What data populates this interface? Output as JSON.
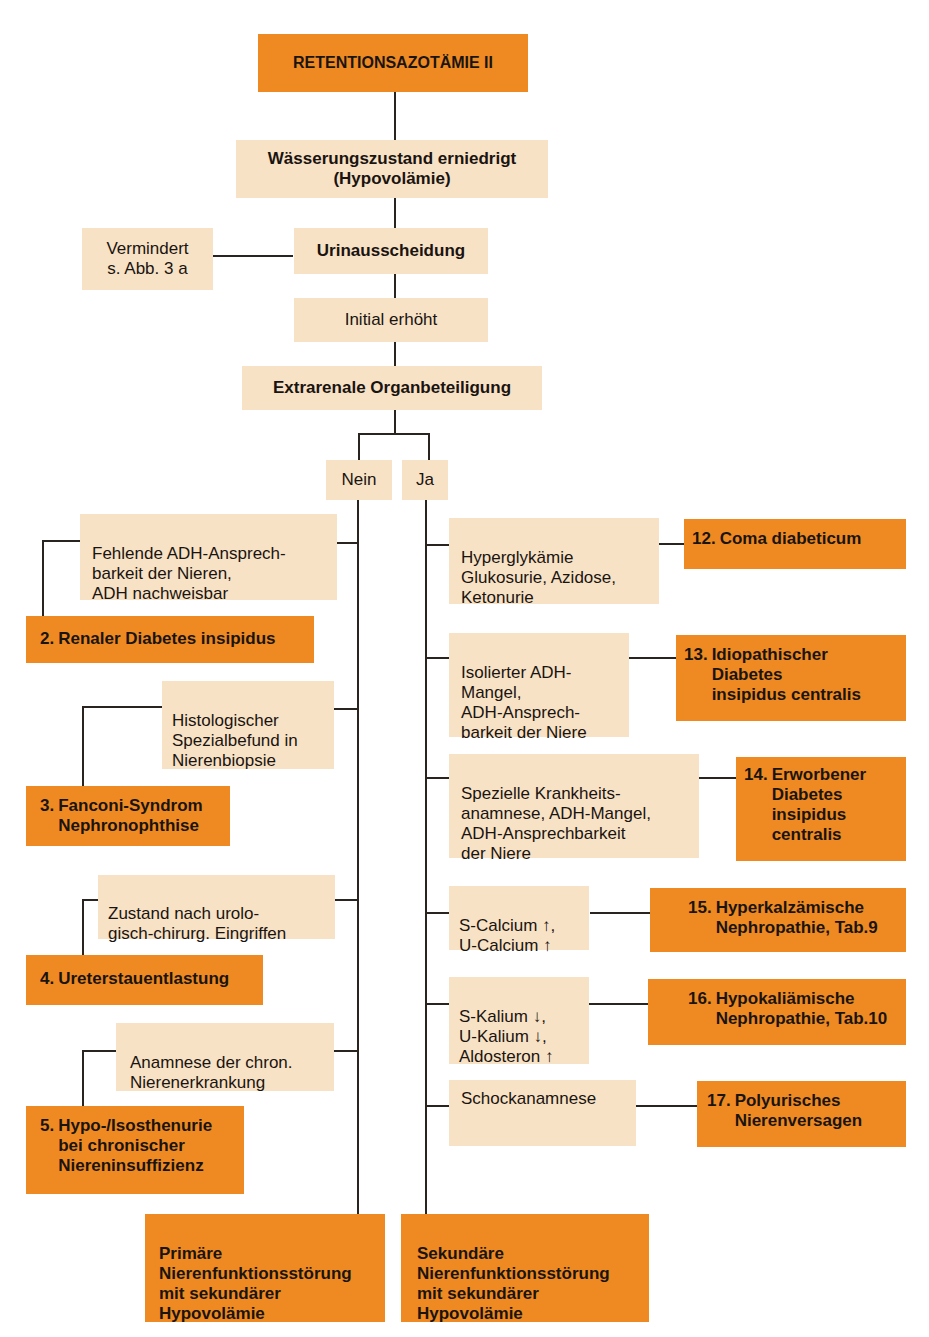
{
  "title": "RETENTIONSAZOTÄMIE II",
  "nodes": {
    "hydration": "Wässerungszustand erniedrigt\n(Hypovolämie)",
    "urine_excretion": "Urinausscheidung",
    "reduced": "Vermindert\ns. Abb. 3 a",
    "initial_increased": "Initial erhöht",
    "extrarenal": "Extrarenale Organbeteiligung",
    "no": "Nein",
    "yes": "Ja"
  },
  "left_branch": {
    "criteria": [
      "Fehlende ADH-Ansprech-\nbarkeit der Nieren,\nADH nachweisbar",
      "Histologischer\nSpezialbefund in\nNierenbiopsie",
      "Zustand nach urolo-\ngisch-chirurg. Eingriffen",
      "Anamnese der chron.\nNierenerkrankung"
    ],
    "diagnoses": [
      {
        "num": "2.",
        "text": "Renaler Diabetes insipidus"
      },
      {
        "num": "3.",
        "text": "Fanconi-Syndrom\nNephronophthise"
      },
      {
        "num": "4.",
        "text": "Ureterstauentlastung"
      },
      {
        "num": "5.",
        "text": "Hypo-/Isosthenurie\nbei chronischer\nNiereninsuffizienz"
      }
    ],
    "conclusion": "Primäre\nNierenfunktionsstörung\nmit sekundärer\nHypovolämie"
  },
  "right_branch": {
    "criteria": [
      "Hyperglykämie\nGlukosurie, Azidose,\nKetonurie",
      "Isolierter ADH-\nMangel,\nADH-Ansprech-\nbarkeit der Niere",
      "Spezielle Krankheits-\nanamnese, ADH-Mangel,\nADH-Ansprechbarkeit\nder Niere",
      "S-Calcium ↑,\nU-Calcium ↑",
      "S-Kalium ↓,\nU-Kalium ↓,\nAldosteron ↑",
      "Schockanamnese"
    ],
    "diagnoses": [
      {
        "num": "12.",
        "text": "Coma diabeticum"
      },
      {
        "num": "13.",
        "text": "Idiopathischer\nDiabetes\ninsipidus centralis"
      },
      {
        "num": "14.",
        "text": "Erworbener\nDiabetes\ninsipidus\ncentralis"
      },
      {
        "num": "15.",
        "text": "Hyperkalzämische\nNephropathie, Tab.9"
      },
      {
        "num": "16.",
        "text": "Hypokaliämische\nNephropathie, Tab.10"
      },
      {
        "num": "17.",
        "text": "Polyurisches\nNierenversagen"
      }
    ],
    "conclusion": "Sekundäre\nNierenfunktionsstörung\nmit sekundärer\nHypovolämie"
  },
  "colors": {
    "orange": "#ef8a22",
    "beige": "#f8e2c6",
    "line": "#2a2420"
  }
}
